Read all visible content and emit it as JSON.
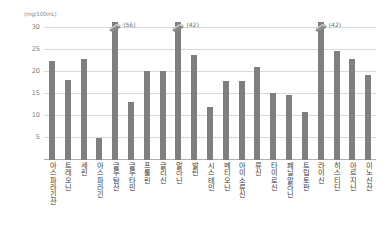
{
  "chart_data": {
    "type": "bar",
    "title": "",
    "subtitle": "",
    "xlabel": "",
    "ylabel": "(mg/100mL)",
    "unit_label": "(mg/100mL)",
    "ylim": [
      0,
      31
    ],
    "ytick_values": [
      5,
      10,
      15,
      20,
      25,
      30
    ],
    "ytick_labels": [
      "5",
      "10",
      "15",
      "20",
      "25",
      "30"
    ],
    "grid": true,
    "legend": "none",
    "bar_color": "#7f7f7f",
    "categories": [
      "아스파라긴산",
      "트레오닌",
      "세린",
      "아스파라긴",
      "글루탐산",
      "글루타민",
      "프롤린",
      "글리신",
      "알라닌",
      "발린",
      "시스테인",
      "메티오닌",
      "아이소류신",
      "류신",
      "타이로신",
      "페닐알라닌",
      "트립토판",
      "라이신",
      "히스티딘",
      "아르지닌",
      "이노신산"
    ],
    "values": [
      22.2,
      18.0,
      22.6,
      5.0,
      31.0,
      13.0,
      20.0,
      20.0,
      31.0,
      23.6,
      12.0,
      17.8,
      17.8,
      21.0,
      15.0,
      14.6,
      10.8,
      31.0,
      24.4,
      22.8,
      19.0
    ],
    "clipped_bars": [
      {
        "category": "글루탐산",
        "index": 4,
        "annotation": "(56)",
        "actual_value": 56
      },
      {
        "category": "알라닌",
        "index": 8,
        "annotation": "(42)",
        "actual_value": 42
      },
      {
        "category": "라이신",
        "index": 17,
        "annotation": "(42)",
        "actual_value": 42
      }
    ],
    "axis_break_marker": "axis-break-icon"
  }
}
